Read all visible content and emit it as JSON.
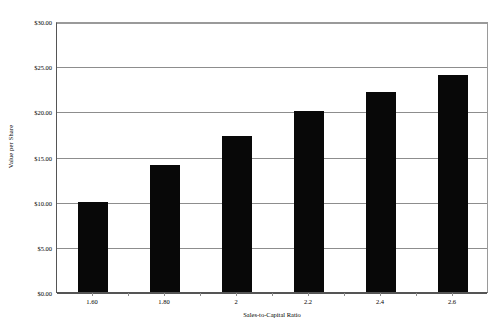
{
  "chart_data": {
    "type": "bar",
    "title": "",
    "subtitle": "",
    "xlabel": "Sales-to-Capital Ratio",
    "ylabel": "Value per Share",
    "categories": [
      "1.60",
      "1.80",
      "2",
      "2.2",
      "2.4",
      "2.6"
    ],
    "values": [
      10.0,
      14.1,
      17.3,
      20.0,
      22.1,
      24.0
    ],
    "ylim": [
      0,
      30
    ],
    "ytick_values": [
      0,
      5,
      10,
      15,
      20,
      25,
      30
    ],
    "ytick_labels": [
      "$0.00",
      "$5.00",
      "$10.00",
      "$15.00",
      "$20.00",
      "$25.00",
      "$30.00"
    ],
    "grid": true,
    "grid_axis": "y",
    "legend": null,
    "legend_position": "none",
    "series": [
      {
        "name": "Value per Share",
        "values": [
          10.0,
          14.1,
          17.3,
          20.0,
          22.1,
          24.0
        ]
      }
    ],
    "colors": {
      "bar_fill": "#080808",
      "gridline": "#8d8d8d",
      "axis": "#555555",
      "plot_background": "#ffffff",
      "text": "#000000"
    }
  }
}
